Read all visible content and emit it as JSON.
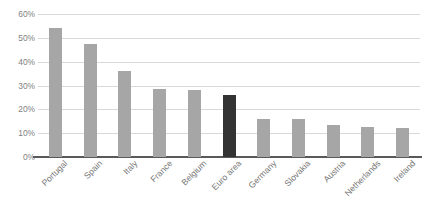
{
  "chart_data": {
    "type": "bar",
    "title": "",
    "subtitle": "",
    "xlabel": "",
    "ylabel": "",
    "ylim": [
      0,
      60
    ],
    "ytick_labels": [
      "60%",
      "50%",
      "40%",
      "30%",
      "20%",
      "10%",
      "0%"
    ],
    "ytick_values": [
      60,
      50,
      40,
      30,
      20,
      10,
      0
    ],
    "grid": true,
    "legend": false,
    "legend_position": "none",
    "categories": [
      "Portugal",
      "Spain",
      "Italy",
      "France",
      "Belgium",
      "Euro area",
      "Germany",
      "Slovakia",
      "Austria",
      "Netherlands",
      "Ireland"
    ],
    "values": [
      54,
      47.5,
      36,
      28.5,
      28,
      26,
      16,
      15.8,
      13.5,
      12.8,
      12
    ],
    "highlight_category": "Euro area",
    "colors": {
      "bar": "#a6a6a6",
      "bar_highlight": "#333333",
      "gridline": "#d9d9d9",
      "axis": "#595959",
      "tick_text": "#7f7f7f",
      "category_text": "#767676",
      "background": "#ffffff"
    }
  }
}
